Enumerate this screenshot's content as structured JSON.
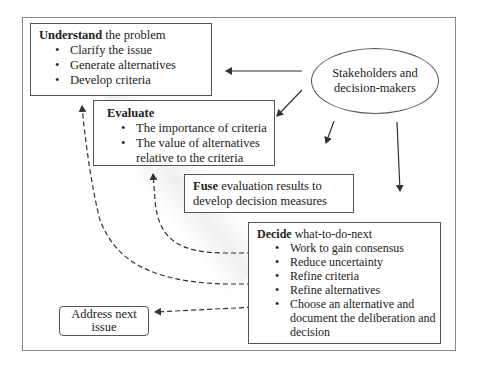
{
  "understand": {
    "title_bold": "Understand",
    "title_rest": " the problem",
    "items": [
      "Clarify the issue",
      "Generate alternatives",
      "Develop criteria"
    ]
  },
  "evaluate": {
    "title_bold": "Evaluate",
    "items": [
      "The importance of criteria",
      "The value of alternatives relative to the criteria"
    ]
  },
  "stakeholders": {
    "line1": "Stakeholders and",
    "line2": "decision-makers"
  },
  "fuse": {
    "title_bold": "Fuse",
    "title_rest": " evaluation results to develop decision measures"
  },
  "decide": {
    "title_bold": "Decide",
    "title_rest": " what-to-do-next",
    "items": [
      "Work to gain consensus",
      "Reduce uncertainty",
      "Refine criteria",
      "Refine alternatives",
      "Choose an alternative and document the deliberation and decision"
    ]
  },
  "address_next": {
    "label": "Address next issue"
  },
  "colors": {
    "line": "#333333",
    "border": "#555555",
    "frame": "#888888"
  }
}
